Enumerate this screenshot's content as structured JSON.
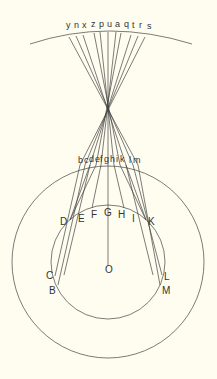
{
  "diagram": {
    "background": "#fefdf0",
    "stroke_color": "#444444",
    "top_labels": [
      "y",
      "n",
      "x",
      "z",
      "p",
      "u",
      "a",
      "q",
      "t",
      "r",
      "s"
    ],
    "lens_labels": [
      "b",
      "c",
      "d",
      "e",
      "f",
      "g",
      "h",
      "i",
      "k",
      "l",
      "m"
    ],
    "eye_labels": {
      "D": "D",
      "E": "E",
      "F": "F",
      "G": "G",
      "H": "H",
      "I": "I",
      "K": "K",
      "C": "C",
      "B": "B",
      "L": "L",
      "M": "M",
      "O": "O"
    }
  }
}
